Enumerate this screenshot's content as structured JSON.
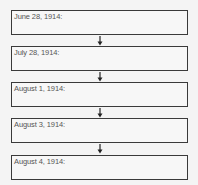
{
  "timeline": {
    "entries": [
      {
        "date": "June 28, 1914:"
      },
      {
        "date": "July 28, 1914:"
      },
      {
        "date": "August 1, 1914:"
      },
      {
        "date": "August 3, 1914:"
      },
      {
        "date": "August 4, 1914:"
      }
    ]
  },
  "colors": {
    "border": "#3a3a3a",
    "text": "#555555",
    "background": "#f4f4f4"
  }
}
